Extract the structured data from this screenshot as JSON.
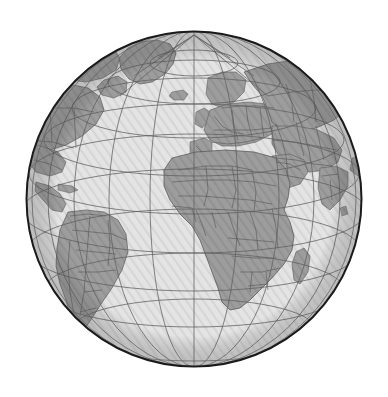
{
  "figure": {
    "title": "Orthographic globe projection",
    "type": "map",
    "width": 388,
    "height": 397,
    "background_color": "#ffffff"
  },
  "map": {
    "projection": "orthographic",
    "center_lon": 10,
    "center_lat": 18,
    "circle": {
      "cx": 194,
      "cy": 199,
      "r": 168
    },
    "colors": {
      "ocean": "#e3e3e3",
      "ocean_hatch": "#d2d2d2",
      "land": "#9b9b9b",
      "land_edge": "#4a4a4a",
      "border": "#555555",
      "graticule": "#5e5e5e",
      "limb": "#1a1a1a",
      "background": "#ffffff"
    },
    "graticule": {
      "meridian_step_deg": 15,
      "parallel_step_deg": 15,
      "visible": true
    },
    "features": [
      "ocean-disc",
      "graticule-lines",
      "continent-landmasses",
      "country-borders",
      "globe-limb-outline"
    ],
    "continents_visible": [
      "Africa",
      "Europe",
      "Asia (western)",
      "Greenland",
      "North America (eastern)",
      "South America",
      "Madagascar",
      "Arabian Peninsula",
      "India (western)"
    ]
  }
}
